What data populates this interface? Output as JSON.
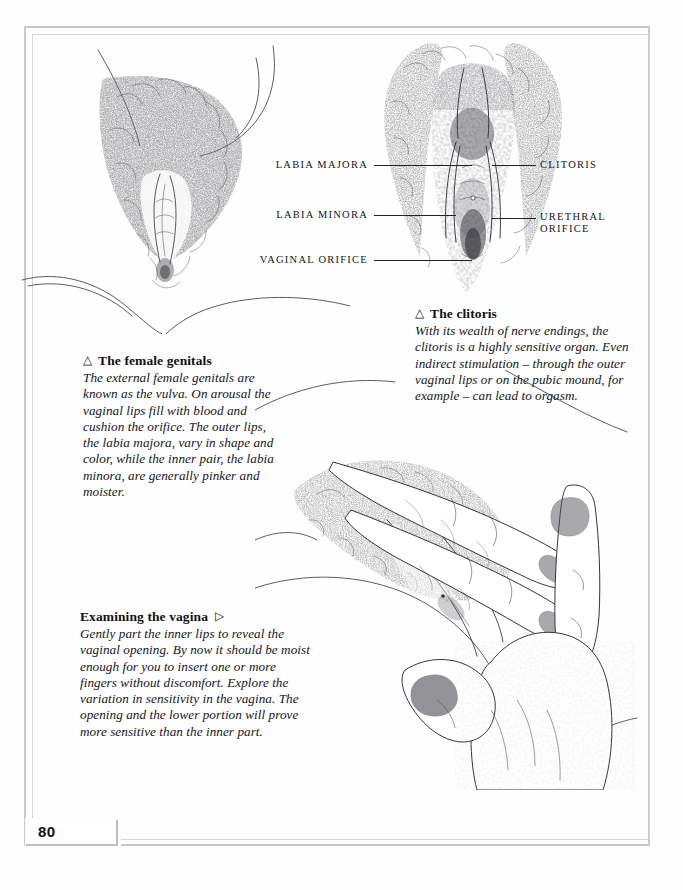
{
  "page": {
    "folio": "80",
    "background_color": "#fefefe",
    "frame_color": "#c9c9cc",
    "ink_color": "#15151c"
  },
  "figures": [
    {
      "name": "female-genitals-illustration",
      "description": "Pencil drawing of external female genitals between thighs, viewed from below"
    },
    {
      "name": "clitoris-closeup-illustration",
      "description": "Pencil drawing close-up of vulva showing clitoris, labia and orifices"
    },
    {
      "name": "examining-vagina-illustration",
      "description": "Line drawing of a hand parting the inner labia with fingers"
    }
  ],
  "labels": [
    {
      "text": "LABIA MAJORA",
      "side": "left"
    },
    {
      "text": "LABIA MINORA",
      "side": "left"
    },
    {
      "text": "VAGINAL ORIFICE",
      "side": "left"
    },
    {
      "text": "CLITORIS",
      "side": "right"
    },
    {
      "text": "URETHRAL",
      "side": "right"
    },
    {
      "text": "ORIFICE",
      "side": "right"
    }
  ],
  "captions": {
    "genitals": {
      "marker": "△",
      "marker_position": "before",
      "heading": "The female genitals",
      "body": "The external female genitals are known as the vulva. On arousal the vaginal lips fill with blood and cushion the orifice. The outer lips, the labia majora, vary in shape and color, while the inner pair, the labia minora, are generally pinker and moister."
    },
    "clitoris": {
      "marker": "△",
      "marker_position": "before",
      "heading": "The clitoris",
      "body": "With its wealth of nerve endings, the clitoris is a highly sensitive organ. Even indirect stimulation – through the outer vaginal lips or on the pubic mound, for example – can lead to orgasm."
    },
    "examining": {
      "marker": "▷",
      "marker_position": "after",
      "heading": "Examining the vagina",
      "body": "Gently part the inner lips to reveal the vaginal opening. By now it should be moist enough for you to insert one or more fingers without discomfort. Explore the variation in sensitivity in the vagina. The opening and the lower portion will prove more sensitive than the inner part."
    }
  }
}
